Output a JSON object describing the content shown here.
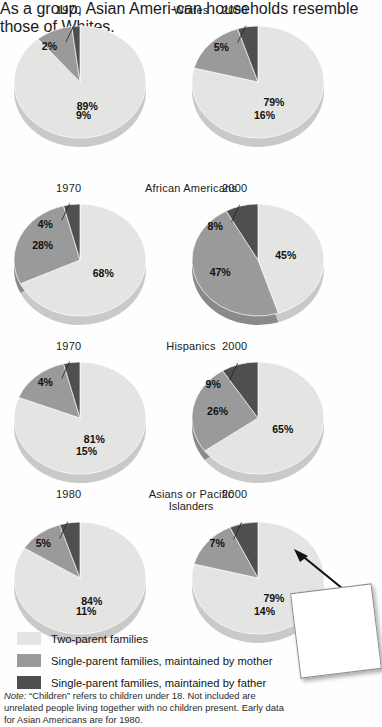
{
  "figure": {
    "legend": [
      {
        "label": "Two-parent families",
        "color": "#e4e4e2",
        "key": "two_parent"
      },
      {
        "label": "Single-parent families, maintained by mother",
        "color": "#9a9a9a",
        "key": "mother"
      },
      {
        "label": "Single-parent families, maintained by father",
        "color": "#4f4f4f",
        "key": "father"
      }
    ],
    "note_prefix": "Note:",
    "note": " “Children” refers to children under 18. Not included are unrelated people living together with no children present. Early data for Asian Americans are for 1980.",
    "sticky_note": "As a group, Asian Ameri-can households resemble those of Whites."
  },
  "chart_data": [
    {
      "type": "pie",
      "title": "Whites",
      "title_line2": "",
      "group": "Whites",
      "legend": [
        "Two-parent families",
        "Single-parent families, maintained by mother",
        "Single-parent families, maintained by father"
      ],
      "charts": [
        {
          "year": "1970",
          "categories": [
            "Two-parent families",
            "Single-parent families, maintained by mother",
            "Single-parent families, maintained by father"
          ],
          "values": [
            89,
            9,
            2
          ],
          "labels": [
            "89%",
            "9%",
            "2%"
          ]
        },
        {
          "year": "2000",
          "categories": [
            "Two-parent families",
            "Single-parent families, maintained by mother",
            "Single-parent families, maintained by father"
          ],
          "values": [
            79,
            16,
            5
          ],
          "labels": [
            "79%",
            "16%",
            "5%"
          ]
        }
      ]
    },
    {
      "type": "pie",
      "title": "African Americans",
      "title_line2": "",
      "group": "African Americans",
      "legend": [
        "Two-parent families",
        "Single-parent families, maintained by mother",
        "Single-parent families, maintained by father"
      ],
      "charts": [
        {
          "year": "1970",
          "categories": [
            "Two-parent families",
            "Single-parent families, maintained by mother",
            "Single-parent families, maintained by father"
          ],
          "values": [
            68,
            28,
            4
          ],
          "labels": [
            "68%",
            "28%",
            "4%"
          ]
        },
        {
          "year": "2000",
          "categories": [
            "Two-parent families",
            "Single-parent families, maintained by mother",
            "Single-parent families, maintained by father"
          ],
          "values": [
            45,
            47,
            8
          ],
          "labels": [
            "45%",
            "47%",
            "8%"
          ]
        }
      ]
    },
    {
      "type": "pie",
      "title": "Hispanics",
      "title_line2": "",
      "group": "Hispanics",
      "legend": [
        "Two-parent families",
        "Single-parent families, maintained by mother",
        "Single-parent families, maintained by father"
      ],
      "charts": [
        {
          "year": "1970",
          "categories": [
            "Two-parent families",
            "Single-parent families, maintained by mother",
            "Single-parent families, maintained by father"
          ],
          "values": [
            81,
            15,
            4
          ],
          "labels": [
            "81%",
            "15%",
            "4%"
          ]
        },
        {
          "year": "2000",
          "categories": [
            "Two-parent families",
            "Single-parent families, maintained by mother",
            "Single-parent families, maintained by father"
          ],
          "values": [
            65,
            26,
            9
          ],
          "labels": [
            "65%",
            "26%",
            "9%"
          ]
        }
      ]
    },
    {
      "type": "pie",
      "title": "Asians or Pacific",
      "title_line2": "Islanders",
      "group": "Asians or Pacific Islanders",
      "legend": [
        "Two-parent families",
        "Single-parent families, maintained by mother",
        "Single-parent families, maintained by father"
      ],
      "charts": [
        {
          "year": "1980",
          "categories": [
            "Two-parent families",
            "Single-parent families, maintained by mother",
            "Single-parent families, maintained by father"
          ],
          "values": [
            84,
            11,
            5
          ],
          "labels": [
            "84%",
            "11%",
            "5%"
          ]
        },
        {
          "year": "2000",
          "categories": [
            "Two-parent families",
            "Single-parent families, maintained by mother",
            "Single-parent families, maintained by father"
          ],
          "values": [
            79,
            14,
            7
          ],
          "labels": [
            "79%",
            "14%",
            "7%"
          ]
        }
      ]
    }
  ]
}
